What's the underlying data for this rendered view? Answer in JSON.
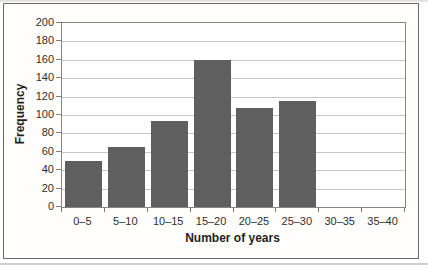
{
  "chart_data": {
    "type": "bar",
    "title": "",
    "xlabel": "Number of years",
    "ylabel": "Frequency",
    "categories": [
      "0–5",
      "5–10",
      "10–15",
      "15–20",
      "20–25",
      "25–30",
      "30–35",
      "35–40"
    ],
    "values": [
      50,
      65,
      93,
      160,
      108,
      115,
      0,
      0
    ],
    "ylim": [
      0,
      200
    ],
    "ytick_step": 20,
    "ytick_labels": [
      "0",
      "20",
      "40",
      "60",
      "80",
      "100",
      "120",
      "140",
      "160",
      "180",
      "200"
    ],
    "grid": "horizontal",
    "legend_position": "none",
    "colors": {
      "bar_fill": "#5f5f5f",
      "gridline": "#c6c6c6",
      "axis_line": "#7f7f7f",
      "plot_border": "#858585",
      "frame_border": "#6a6a6a",
      "tick_text": "#2e2e2e",
      "title_text": "#1f1f1f",
      "background": "#ffffff"
    }
  }
}
